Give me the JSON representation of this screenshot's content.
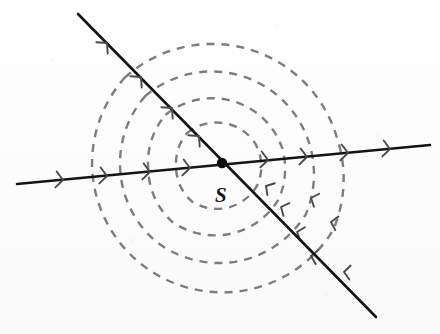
{
  "figure": {
    "width": 440,
    "height": 334,
    "background_color": "#fdfdfd"
  },
  "labels": {
    "source": "S",
    "source_x": 215,
    "source_y": 185
  },
  "colors": {
    "line": "#141414",
    "wavefront": "#7d7d7d",
    "chevron": "#4a4a4a",
    "dot": "#0d0d0d",
    "background": "#fdfdfd"
  },
  "source_point": {
    "name": "S",
    "x": 222,
    "y": 163,
    "radius": 5.2
  },
  "lines": [
    {
      "name": "descending-ray",
      "x1": 78,
      "y1": 14,
      "x2": 376,
      "y2": 317,
      "direction": "up-left"
    },
    {
      "name": "shallow-ray",
      "x1": 17,
      "y1": 184,
      "x2": 430,
      "y2": 145,
      "direction": "left"
    }
  ],
  "chevrons": [
    {
      "line": "descending-ray",
      "x": 107,
      "y": 43,
      "angle": 45
    },
    {
      "line": "descending-ray",
      "x": 141,
      "y": 77,
      "angle": 45
    },
    {
      "line": "descending-ray",
      "x": 172,
      "y": 108,
      "angle": 45
    },
    {
      "line": "descending-ray",
      "x": 199,
      "y": 136,
      "angle": 45
    },
    {
      "line": "shallow-ray",
      "x": 63,
      "y": 180,
      "angle": -5.4
    },
    {
      "line": "shallow-ray",
      "x": 107,
      "y": 176,
      "angle": -5.4
    },
    {
      "line": "shallow-ray",
      "x": 150,
      "y": 172,
      "angle": -5.4
    },
    {
      "line": "shallow-ray",
      "x": 190,
      "y": 168,
      "angle": -5.4
    },
    {
      "line": "shallow-ray",
      "x": 268,
      "y": 160,
      "angle": -5.4
    },
    {
      "line": "shallow-ray",
      "x": 307,
      "y": 157,
      "angle": -5.4
    },
    {
      "line": "shallow-ray",
      "x": 348,
      "y": 153,
      "angle": -5.4
    },
    {
      "line": "shallow-ray",
      "x": 390,
      "y": 149,
      "angle": -5.4
    }
  ],
  "wavefronts": [
    {
      "name": "wavefront-1",
      "radius": 46,
      "order": 1
    },
    {
      "name": "wavefront-2",
      "radius": 74,
      "order": 2
    },
    {
      "name": "wavefront-3",
      "radius": 102,
      "order": 3
    },
    {
      "name": "wavefront-4",
      "radius": 130,
      "order": 4
    }
  ],
  "wavefront_arrows": [
    {
      "x": 281,
      "y": 207,
      "angle": 115
    },
    {
      "x": 297,
      "y": 232,
      "angle": 108
    },
    {
      "x": 311,
      "y": 256,
      "angle": 100
    },
    {
      "x": 344,
      "y": 272,
      "angle": 95
    },
    {
      "x": 266,
      "y": 186,
      "angle": 122
    },
    {
      "x": 311,
      "y": 198,
      "angle": 112
    },
    {
      "x": 331,
      "y": 222,
      "angle": 103
    }
  ],
  "caption": {
    "description": "Two straight rays cross at point S; concentric dashed circular wavefronts spread outward from S."
  }
}
